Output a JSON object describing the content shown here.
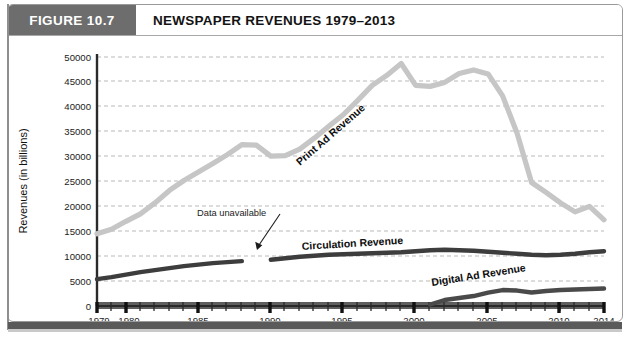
{
  "figure": {
    "tag_label": "FIGURE 10.7",
    "title": "NEWSPAPER REVENUES 1979–2013",
    "tag_bg": "#6d6d6d"
  },
  "axes": {
    "y_title": "Revenues (in billions)",
    "y_ticks": [
      "0",
      "5000",
      "10000",
      "15000",
      "20000",
      "25000",
      "30000",
      "35000",
      "40000",
      "45000",
      "50000"
    ],
    "x_ticks_major": [
      "1979",
      "1980",
      "1985",
      "1990",
      "1995",
      "2000",
      "2005",
      "2010",
      "2014"
    ]
  },
  "annotations": {
    "print_label": "Print Ad Revenue",
    "circulation_label": "Circulation Revenue",
    "digital_label": "Digital Ad Revenue",
    "data_unavailable": "Data unavailable"
  },
  "colors": {
    "print": "#c6c6c6",
    "circulation": "#3d3d3d",
    "digital": "#4a4a4a",
    "gridline": "#b9b9b9",
    "axis": "#2a2a2a"
  },
  "chart_data": {
    "type": "line",
    "title": "NEWSPAPER REVENUES 1979–2013",
    "xlabel": "",
    "ylabel": "Revenues (in billions)",
    "ylim": [
      0,
      50000
    ],
    "xlim": [
      1979,
      2014
    ],
    "grid": true,
    "legend": "inline-labels",
    "x": [
      1979,
      1980,
      1981,
      1982,
      1983,
      1984,
      1985,
      1986,
      1987,
      1988,
      1989,
      1990,
      1991,
      1992,
      1993,
      1994,
      1995,
      1996,
      1997,
      1998,
      1999,
      2000,
      2001,
      2002,
      2003,
      2004,
      2005,
      2006,
      2007,
      2008,
      2009,
      2010,
      2011,
      2012,
      2013,
      2014
    ],
    "series": [
      {
        "name": "Print Ad Revenue",
        "color": "#c6c6c6",
        "values": [
          14500,
          15400,
          17000,
          18500,
          20700,
          23200,
          25200,
          26900,
          28600,
          30400,
          32400,
          32300,
          30100,
          30200,
          31500,
          33700,
          36100,
          38400,
          41300,
          44300,
          46300,
          48700,
          44300,
          44100,
          44900,
          46700,
          47400,
          46600,
          42200,
          34700,
          24800,
          22800,
          20700,
          18900,
          20000,
          17300
        ]
      },
      {
        "name": "Circulation Revenue",
        "color": "#3d3d3d",
        "values": [
          5400,
          5800,
          6300,
          6800,
          7200,
          7600,
          8000,
          8300,
          8600,
          8800,
          9000,
          null,
          9300,
          9600,
          9900,
          10100,
          10300,
          10400,
          10500,
          10600,
          10700,
          10800,
          11000,
          11200,
          11300,
          11200,
          11100,
          10900,
          10700,
          10500,
          10300,
          10200,
          10300,
          10500,
          10800,
          11000
        ]
      },
      {
        "name": "Digital Ad Revenue",
        "color": "#4a4a4a",
        "values": [
          null,
          null,
          null,
          null,
          null,
          null,
          null,
          null,
          null,
          null,
          null,
          null,
          null,
          null,
          null,
          null,
          null,
          null,
          null,
          null,
          null,
          null,
          null,
          300,
          1200,
          1600,
          2000,
          2700,
          3200,
          3100,
          2700,
          3000,
          3200,
          3300,
          3400,
          3500
        ]
      }
    ]
  }
}
